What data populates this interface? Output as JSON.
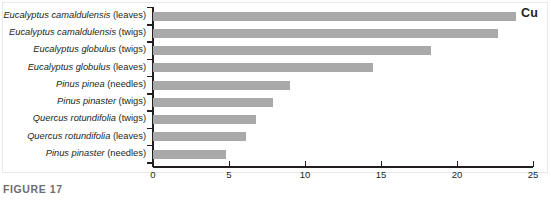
{
  "figure": {
    "caption": "FIGURE 17",
    "series_label": "Cu"
  },
  "chart_data": {
    "type": "bar",
    "orientation": "horizontal",
    "title": "",
    "subtitle": "",
    "xlabel": "",
    "ylabel": "",
    "xlim": [
      0,
      25
    ],
    "xticks": [
      0,
      5,
      10,
      15,
      20,
      25
    ],
    "xticklabels": [
      "0",
      "5",
      "10",
      "15",
      "20",
      "25"
    ],
    "grid": false,
    "legend": "Cu",
    "legend_position": "top-right",
    "bar_color": "#a9a9a9",
    "axis_color": "#231f20",
    "categories": [
      "Eucalyptus camaldulensis (leaves)",
      "Eucalyptus camaldulensis (twigs)",
      "Eucalyptus globulus (twigs)",
      "Eucalyptus globulus (leaves)",
      "Pinus pinea (needles)",
      "Pinus pinaster (twigs)",
      "Quercus rotundifolia (twigs)",
      "Quercus rotundifolia (leaves)",
      "Pinus pinaster (needles)"
    ],
    "categories_parts": [
      {
        "species": "Eucalyptus camaldulensis",
        "part": " (leaves)"
      },
      {
        "species": "Eucalyptus camaldulensis",
        "part": " (twigs)"
      },
      {
        "species": "Eucalyptus globulus",
        "part": " (twigs)"
      },
      {
        "species": "Eucalyptus globulus",
        "part": " (leaves)"
      },
      {
        "species": "Pinus pinea",
        "part": " (needles)"
      },
      {
        "species": "Pinus pinaster",
        "part": " (twigs)"
      },
      {
        "species": "Quercus rotundifolia",
        "part": " (twigs)"
      },
      {
        "species": "Quercus rotundifolia",
        "part": " (leaves)"
      },
      {
        "species": "Pinus pinaster",
        "part": " (needles)"
      }
    ],
    "values": [
      23.9,
      22.7,
      18.3,
      14.5,
      9.0,
      7.9,
      6.8,
      6.1,
      4.8
    ]
  }
}
